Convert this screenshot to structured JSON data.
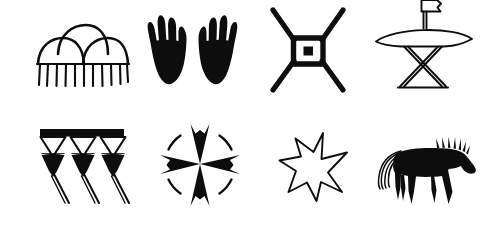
{
  "canvas": {
    "width": 483,
    "height": 246,
    "background_color": "#ffffff",
    "ink_color": "#0d0d0d",
    "description": "Plate of eight hand-drawn black-and-white pictographic symbols arranged in two rows of four"
  },
  "layout": {
    "rows": 2,
    "columns": 4,
    "total_symbols": 8
  },
  "symbols": [
    {
      "index": 1,
      "row": 1,
      "column": 1,
      "name": "three-arches-with-tick-fringe",
      "label": "Three Arches over Fringe",
      "style": "outline",
      "description": "Three overlapping semicircular arches (one centered above two) resting on a horizontal baseline, with eleven short vertical tick marks hanging below the baseline",
      "tick_count": 11,
      "arch_count": 3
    },
    {
      "index": 2,
      "row": 1,
      "column": 2,
      "name": "pair-of-hands",
      "label": "Pair of Hands",
      "style": "solid",
      "description": "Two solid black mirrored hands or paws, each with four splayed fingers, tapering to narrow wrists",
      "hand_count": 2,
      "fingers_per_hand": 4
    },
    {
      "index": 3,
      "row": 1,
      "column": 3,
      "name": "spool-with-dotted-square",
      "label": "Spool with Dotted Square",
      "style": "solid-outline",
      "description": "An hourglass or spool figure formed by four splayed diagonal legs meeting a thick-bordered central square which encloses a small solid black square",
      "leg_count": 4
    },
    {
      "index": 4,
      "row": 1,
      "column": 4,
      "name": "altar-with-banner",
      "label": "Altar with Banner",
      "style": "outline",
      "description": "A wide crescent or canoe-shaped horizontal slab supported by an hourglass pedestal above a triangular base, topped by a short vertical post carrying a small rectangular flag or banner",
      "parts": [
        "banner",
        "post",
        "crescent-slab",
        "hourglass-pedestal",
        "triangular-base"
      ]
    },
    {
      "index": 5,
      "row": 2,
      "column": 1,
      "name": "three-hanging-pendants",
      "label": "Three Hanging Pendants",
      "style": "solid-outline",
      "description": "A thick horizontal black bar from which hang three pendants, each an open white triangle above a solid black diamond, with a thin tapering tail trailing down and to the right",
      "pendant_count": 3
    },
    {
      "index": 6,
      "row": 2,
      "column": 2,
      "name": "maltese-cross-in-broken-circle",
      "label": "Maltese Cross in Broken Circle",
      "style": "solid-outline",
      "description": "A four-armed cross with concave flaring black arms centered inside a circle drawn as four separate curved arc segments set between the arms",
      "arm_count": 4,
      "arc_count": 4
    },
    {
      "index": 7,
      "row": 2,
      "column": 3,
      "name": "six-pointed-star",
      "label": "Six-Pointed Star",
      "style": "outline",
      "description": "An irregular hand-drawn six-pointed star rendered as a thin unfilled outline with uneven point lengths",
      "point_count": 6
    },
    {
      "index": 8,
      "row": 2,
      "column": 4,
      "name": "horse-silhouette",
      "label": "Horse Silhouette",
      "style": "solid",
      "description": "A solid black profile silhouette of a horse facing right, with a spiky upright bristle mane, four legs, and a long streaming tail drawn as thin trailing lines to the left",
      "facing": "right",
      "leg_count": 4,
      "mane_spike_count": 7
    }
  ]
}
